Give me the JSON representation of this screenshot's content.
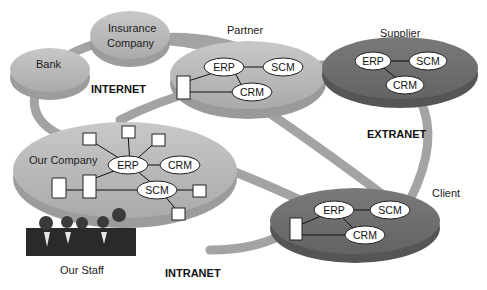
{
  "nodes": {
    "bank": {
      "label": "Bank"
    },
    "insurance": {
      "label_line1": "Insurance",
      "label_line2": "Company"
    },
    "partner": {
      "label": "Partner",
      "systems": [
        "ERP",
        "SCM",
        "CRM"
      ]
    },
    "supplier": {
      "label": "Supplier",
      "systems": [
        "ERP",
        "SCM",
        "CRM"
      ]
    },
    "our_company": {
      "label": "Our Company",
      "systems": [
        "ERP",
        "CRM",
        "SCM"
      ]
    },
    "client": {
      "label": "Client",
      "systems": [
        "ERP",
        "SCM",
        "CRM"
      ]
    },
    "staff": {
      "label": "Our Staff"
    }
  },
  "zones": {
    "internet": "INTERNET",
    "extranet": "EXTRANET",
    "intranet": "INTRANET"
  },
  "colors": {
    "light_disc": "#b4b4b4",
    "dark_disc": "#6e6e6e",
    "ring": "#a9a9a9"
  }
}
